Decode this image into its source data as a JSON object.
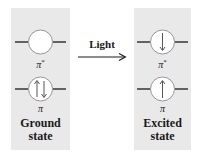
{
  "diagram": {
    "type": "orbital-transition",
    "transition_label": "Light",
    "states": [
      {
        "name": "ground",
        "label": "Ground state",
        "label_line1": "Ground",
        "label_line2": "state",
        "orbitals": [
          {
            "name": "pi-star",
            "label": "π",
            "superscript": "*",
            "electrons": []
          },
          {
            "name": "pi",
            "label": "π",
            "superscript": "",
            "electrons": [
              "up",
              "down"
            ]
          }
        ]
      },
      {
        "name": "excited",
        "label": "Excited state",
        "label_line1": "Excited",
        "label_line2": "state",
        "orbitals": [
          {
            "name": "pi-star",
            "label": "π",
            "superscript": "*",
            "electrons": [
              "down"
            ]
          },
          {
            "name": "pi",
            "label": "π",
            "superscript": "",
            "electrons": [
              "up"
            ]
          }
        ]
      }
    ],
    "colors": {
      "panel_bg": "#e9e9e9",
      "orbital_fill": "#ffffff",
      "line": "#1a1a1a",
      "circle_stroke": "#8a8a8a"
    }
  }
}
